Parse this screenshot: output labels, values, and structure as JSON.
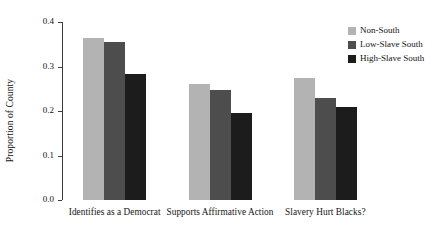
{
  "chart_data": {
    "type": "bar",
    "title": "",
    "xlabel": "",
    "ylabel": "Proportion of County",
    "ylim": [
      0.0,
      0.4
    ],
    "ytick_labels": [
      "0.0",
      "0.1",
      "0.2",
      "0.3",
      "0.4"
    ],
    "ytick_values": [
      0.0,
      0.1,
      0.2,
      0.3,
      0.4
    ],
    "grid": false,
    "legend_position": "top-right",
    "categories": [
      "Identifies as a Democrat",
      "Supports Affirmative Action",
      "Slavery Hurt Blacks?"
    ],
    "series": [
      {
        "name": "Non-South",
        "color": "#b3b3b3",
        "values": [
          0.365,
          0.26,
          0.275
        ]
      },
      {
        "name": "Low-Slave South",
        "color": "#4d4d4d",
        "values": [
          0.355,
          0.247,
          0.23
        ]
      },
      {
        "name": "High-Slave South",
        "color": "#1c1c1c",
        "values": [
          0.283,
          0.196,
          0.21
        ]
      }
    ]
  },
  "legend": {
    "items": [
      {
        "label": "Non-South"
      },
      {
        "label": "Low-Slave South"
      },
      {
        "label": "High-Slave South"
      }
    ]
  }
}
